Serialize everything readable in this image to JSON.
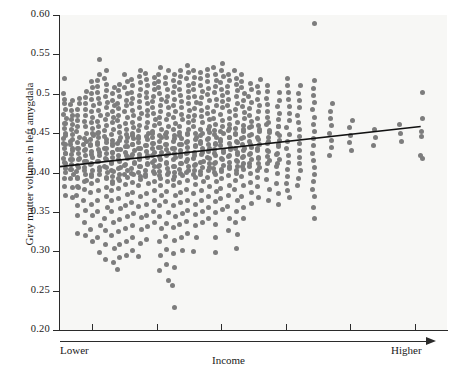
{
  "chart_data": {
    "type": "scatter",
    "title": "",
    "xlabel": "Income",
    "ylabel": "Gray matter volume in left amygdala",
    "x_axis": {
      "low_label": "Lower",
      "high_label": "Higher",
      "tick_labels": [
        "",
        "",
        "",
        "",
        "",
        ""
      ],
      "n_ticks": 6,
      "range_note": "ordinal income bins, unlabeled ticks"
    },
    "y_axis": {
      "tick_labels": [
        "0.20",
        "0.25",
        "0.30",
        "0.35",
        "0.40",
        "0.45",
        "0.5",
        "0.55",
        "0.60"
      ],
      "tick_values": [
        0.2,
        0.25,
        0.3,
        0.35,
        0.4,
        0.45,
        0.5,
        0.55,
        0.6
      ],
      "ylim": [
        0.2,
        0.6
      ]
    },
    "grid": false,
    "legend": null,
    "marker_color": "#7d7d7d",
    "background_color": "#f7f7f5",
    "trendline": {
      "color": "#111111",
      "x_start_frac": 0.0,
      "x_end_frac": 0.932,
      "y_start": 0.4075,
      "y_end": 0.4585
    },
    "columns": [
      {
        "x_frac": 0.012,
        "values": [
          0.405,
          0.412,
          0.418,
          0.424,
          0.43,
          0.437,
          0.443,
          0.45,
          0.456,
          0.462,
          0.468,
          0.474,
          0.48,
          0.488,
          0.493,
          0.5,
          0.519,
          0.462,
          0.447,
          0.436,
          0.424,
          0.413,
          0.4,
          0.392,
          0.382,
          0.371
        ]
      },
      {
        "x_frac": 0.03,
        "values": [
          0.398,
          0.404,
          0.41,
          0.417,
          0.423,
          0.43,
          0.436,
          0.442,
          0.448,
          0.455,
          0.461,
          0.467,
          0.473,
          0.479,
          0.486,
          0.492,
          0.44,
          0.428,
          0.416,
          0.404,
          0.393,
          0.381,
          0.368
        ]
      },
      {
        "x_frac": 0.047,
        "values": [
          0.381,
          0.392,
          0.401,
          0.409,
          0.417,
          0.424,
          0.431,
          0.438,
          0.445,
          0.452,
          0.459,
          0.466,
          0.473,
          0.48,
          0.487,
          0.494,
          0.43,
          0.418,
          0.406,
          0.394,
          0.382,
          0.371,
          0.358,
          0.345,
          0.322
        ]
      },
      {
        "x_frac": 0.065,
        "values": [
          0.389,
          0.398,
          0.406,
          0.414,
          0.421,
          0.429,
          0.436,
          0.443,
          0.45,
          0.458,
          0.465,
          0.472,
          0.48,
          0.488,
          0.495,
          0.503,
          0.44,
          0.428,
          0.414,
          0.403,
          0.39,
          0.378,
          0.365,
          0.352,
          0.336,
          0.32
        ]
      },
      {
        "x_frac": 0.082,
        "values": [
          0.395,
          0.403,
          0.411,
          0.419,
          0.427,
          0.434,
          0.442,
          0.449,
          0.456,
          0.463,
          0.47,
          0.478,
          0.485,
          0.493,
          0.5,
          0.508,
          0.516,
          0.447,
          0.435,
          0.423,
          0.41,
          0.398,
          0.386,
          0.374,
          0.36,
          0.346,
          0.328,
          0.313
        ]
      },
      {
        "x_frac": 0.1,
        "values": [
          0.398,
          0.406,
          0.414,
          0.421,
          0.429,
          0.436,
          0.444,
          0.451,
          0.458,
          0.465,
          0.472,
          0.479,
          0.487,
          0.494,
          0.501,
          0.509,
          0.517,
          0.525,
          0.543,
          0.45,
          0.438,
          0.426,
          0.414,
          0.402,
          0.39,
          0.377,
          0.365,
          0.35,
          0.333,
          0.317,
          0.298
        ]
      },
      {
        "x_frac": 0.118,
        "values": [
          0.392,
          0.4,
          0.408,
          0.416,
          0.424,
          0.431,
          0.438,
          0.446,
          0.453,
          0.46,
          0.467,
          0.474,
          0.482,
          0.489,
          0.496,
          0.504,
          0.512,
          0.52,
          0.53,
          0.442,
          0.43,
          0.418,
          0.406,
          0.394,
          0.381,
          0.369,
          0.356,
          0.341,
          0.326,
          0.308,
          0.29
        ]
      },
      {
        "x_frac": 0.136,
        "values": [
          0.386,
          0.395,
          0.403,
          0.411,
          0.419,
          0.426,
          0.434,
          0.441,
          0.448,
          0.455,
          0.463,
          0.47,
          0.477,
          0.485,
          0.492,
          0.5,
          0.508,
          0.437,
          0.425,
          0.413,
          0.401,
          0.389,
          0.377,
          0.364,
          0.35,
          0.336,
          0.32,
          0.304,
          0.286
        ]
      },
      {
        "x_frac": 0.153,
        "values": [
          0.39,
          0.398,
          0.406,
          0.414,
          0.422,
          0.429,
          0.437,
          0.444,
          0.451,
          0.459,
          0.466,
          0.473,
          0.481,
          0.488,
          0.496,
          0.504,
          0.512,
          0.441,
          0.429,
          0.417,
          0.405,
          0.393,
          0.38,
          0.367,
          0.354,
          0.34,
          0.325,
          0.309,
          0.292,
          0.277
        ]
      },
      {
        "x_frac": 0.171,
        "values": [
          0.394,
          0.402,
          0.41,
          0.418,
          0.425,
          0.433,
          0.44,
          0.448,
          0.455,
          0.462,
          0.47,
          0.477,
          0.485,
          0.492,
          0.5,
          0.508,
          0.516,
          0.524,
          0.445,
          0.433,
          0.421,
          0.409,
          0.397,
          0.385,
          0.372,
          0.358,
          0.344,
          0.329,
          0.312,
          0.294
        ]
      },
      {
        "x_frac": 0.188,
        "values": [
          0.397,
          0.405,
          0.413,
          0.42,
          0.428,
          0.435,
          0.443,
          0.45,
          0.457,
          0.464,
          0.472,
          0.479,
          0.487,
          0.494,
          0.502,
          0.51,
          0.518,
          0.447,
          0.435,
          0.423,
          0.411,
          0.399,
          0.387,
          0.375,
          0.362,
          0.348,
          0.333,
          0.317,
          0.301
        ]
      },
      {
        "x_frac": 0.206,
        "values": [
          0.391,
          0.4,
          0.408,
          0.416,
          0.423,
          0.431,
          0.438,
          0.446,
          0.453,
          0.46,
          0.468,
          0.475,
          0.483,
          0.49,
          0.498,
          0.506,
          0.514,
          0.522,
          0.53,
          0.443,
          0.431,
          0.419,
          0.407,
          0.395,
          0.383,
          0.37,
          0.357,
          0.343,
          0.327,
          0.31,
          0.293
        ]
      },
      {
        "x_frac": 0.224,
        "values": [
          0.395,
          0.403,
          0.411,
          0.419,
          0.427,
          0.434,
          0.442,
          0.449,
          0.457,
          0.464,
          0.472,
          0.479,
          0.487,
          0.495,
          0.502,
          0.51,
          0.518,
          0.526,
          0.446,
          0.434,
          0.422,
          0.41,
          0.398,
          0.386,
          0.373,
          0.36,
          0.346,
          0.331,
          0.315
        ]
      },
      {
        "x_frac": 0.242,
        "values": [
          0.399,
          0.407,
          0.415,
          0.422,
          0.43,
          0.437,
          0.445,
          0.452,
          0.46,
          0.467,
          0.475,
          0.482,
          0.49,
          0.497,
          0.505,
          0.513,
          0.521,
          0.449,
          0.437,
          0.425,
          0.413,
          0.401,
          0.389,
          0.377,
          0.364,
          0.351,
          0.337
        ]
      },
      {
        "x_frac": 0.259,
        "values": [
          0.393,
          0.401,
          0.409,
          0.417,
          0.425,
          0.432,
          0.44,
          0.447,
          0.455,
          0.462,
          0.47,
          0.477,
          0.485,
          0.493,
          0.5,
          0.508,
          0.516,
          0.524,
          0.533,
          0.444,
          0.432,
          0.42,
          0.408,
          0.396,
          0.384,
          0.371,
          0.358,
          0.344,
          0.329,
          0.312,
          0.294,
          0.276
        ]
      },
      {
        "x_frac": 0.277,
        "values": [
          0.397,
          0.405,
          0.413,
          0.421,
          0.429,
          0.436,
          0.444,
          0.451,
          0.459,
          0.467,
          0.474,
          0.482,
          0.49,
          0.497,
          0.505,
          0.513,
          0.521,
          0.529,
          0.448,
          0.436,
          0.424,
          0.412,
          0.4,
          0.388,
          0.376,
          0.363,
          0.349,
          0.335,
          0.319,
          0.302,
          0.283,
          0.263
        ]
      },
      {
        "x_frac": 0.295,
        "values": [
          0.391,
          0.4,
          0.408,
          0.416,
          0.424,
          0.431,
          0.439,
          0.447,
          0.454,
          0.462,
          0.47,
          0.477,
          0.485,
          0.493,
          0.501,
          0.509,
          0.517,
          0.525,
          0.443,
          0.431,
          0.419,
          0.407,
          0.395,
          0.383,
          0.371,
          0.358,
          0.344,
          0.33,
          0.314,
          0.297,
          0.279,
          0.256,
          0.229
        ]
      },
      {
        "x_frac": 0.312,
        "values": [
          0.396,
          0.404,
          0.412,
          0.42,
          0.428,
          0.436,
          0.443,
          0.451,
          0.459,
          0.467,
          0.474,
          0.482,
          0.49,
          0.498,
          0.506,
          0.514,
          0.522,
          0.53,
          0.447,
          0.435,
          0.423,
          0.411,
          0.399,
          0.387,
          0.375,
          0.362,
          0.348,
          0.334,
          0.318,
          0.301
        ]
      },
      {
        "x_frac": 0.33,
        "values": [
          0.4,
          0.408,
          0.416,
          0.424,
          0.432,
          0.44,
          0.448,
          0.455,
          0.463,
          0.471,
          0.479,
          0.487,
          0.495,
          0.503,
          0.511,
          0.519,
          0.527,
          0.536,
          0.45,
          0.438,
          0.426,
          0.414,
          0.402,
          0.39,
          0.378,
          0.365,
          0.352,
          0.338,
          0.323
        ]
      },
      {
        "x_frac": 0.348,
        "values": [
          0.394,
          0.402,
          0.41,
          0.418,
          0.426,
          0.434,
          0.442,
          0.45,
          0.458,
          0.466,
          0.473,
          0.481,
          0.489,
          0.497,
          0.505,
          0.513,
          0.521,
          0.529,
          0.445,
          0.433,
          0.421,
          0.409,
          0.397,
          0.385,
          0.373,
          0.36,
          0.347,
          0.333,
          0.317,
          0.3
        ]
      },
      {
        "x_frac": 0.366,
        "values": [
          0.398,
          0.406,
          0.414,
          0.423,
          0.431,
          0.439,
          0.447,
          0.455,
          0.463,
          0.471,
          0.479,
          0.487,
          0.495,
          0.503,
          0.511,
          0.519,
          0.527,
          0.449,
          0.437,
          0.425,
          0.413,
          0.401,
          0.389,
          0.377,
          0.364,
          0.35,
          0.336
        ]
      },
      {
        "x_frac": 0.384,
        "values": [
          0.403,
          0.411,
          0.419,
          0.427,
          0.435,
          0.443,
          0.451,
          0.459,
          0.467,
          0.475,
          0.483,
          0.491,
          0.499,
          0.507,
          0.515,
          0.523,
          0.531,
          0.454,
          0.442,
          0.43,
          0.418,
          0.406,
          0.394,
          0.382,
          0.369,
          0.355,
          0.341
        ]
      },
      {
        "x_frac": 0.401,
        "values": [
          0.397,
          0.405,
          0.413,
          0.421,
          0.429,
          0.437,
          0.445,
          0.453,
          0.461,
          0.469,
          0.477,
          0.485,
          0.493,
          0.501,
          0.509,
          0.517,
          0.525,
          0.533,
          0.448,
          0.436,
          0.424,
          0.412,
          0.4,
          0.388,
          0.376,
          0.363,
          0.349,
          0.334,
          0.318,
          0.299
        ]
      },
      {
        "x_frac": 0.419,
        "values": [
          0.401,
          0.409,
          0.418,
          0.426,
          0.434,
          0.442,
          0.45,
          0.458,
          0.466,
          0.474,
          0.482,
          0.49,
          0.498,
          0.506,
          0.514,
          0.522,
          0.53,
          0.539,
          0.452,
          0.44,
          0.428,
          0.416,
          0.404,
          0.392,
          0.38,
          0.367,
          0.353
        ]
      },
      {
        "x_frac": 0.437,
        "values": [
          0.405,
          0.413,
          0.421,
          0.429,
          0.437,
          0.445,
          0.453,
          0.461,
          0.469,
          0.477,
          0.485,
          0.493,
          0.501,
          0.509,
          0.517,
          0.525,
          0.456,
          0.444,
          0.432,
          0.42,
          0.408,
          0.396,
          0.384,
          0.371,
          0.357,
          0.342,
          0.326
        ]
      },
      {
        "x_frac": 0.455,
        "values": [
          0.399,
          0.407,
          0.415,
          0.423,
          0.431,
          0.44,
          0.448,
          0.456,
          0.464,
          0.472,
          0.48,
          0.488,
          0.496,
          0.504,
          0.512,
          0.52,
          0.529,
          0.45,
          0.438,
          0.426,
          0.414,
          0.402,
          0.39,
          0.378,
          0.365,
          0.351,
          0.337,
          0.321,
          0.304
        ]
      },
      {
        "x_frac": 0.473,
        "values": [
          0.404,
          0.412,
          0.42,
          0.428,
          0.436,
          0.444,
          0.452,
          0.46,
          0.468,
          0.476,
          0.484,
          0.492,
          0.5,
          0.508,
          0.516,
          0.524,
          0.455,
          0.443,
          0.431,
          0.419,
          0.407,
          0.395,
          0.383,
          0.37,
          0.356,
          0.341
        ]
      },
      {
        "x_frac": 0.492,
        "values": [
          0.408,
          0.416,
          0.424,
          0.432,
          0.44,
          0.448,
          0.457,
          0.465,
          0.473,
          0.481,
          0.489,
          0.497,
          0.505,
          0.513,
          0.459,
          0.447,
          0.435,
          0.423,
          0.411,
          0.399,
          0.387,
          0.374,
          0.361
        ]
      },
      {
        "x_frac": 0.513,
        "values": [
          0.403,
          0.411,
          0.419,
          0.428,
          0.436,
          0.444,
          0.452,
          0.46,
          0.468,
          0.477,
          0.485,
          0.493,
          0.501,
          0.509,
          0.518,
          0.454,
          0.442,
          0.43,
          0.418,
          0.406,
          0.394,
          0.382,
          0.368
        ]
      },
      {
        "x_frac": 0.537,
        "values": [
          0.412,
          0.42,
          0.428,
          0.437,
          0.445,
          0.453,
          0.461,
          0.47,
          0.478,
          0.486,
          0.494,
          0.503,
          0.511,
          0.463,
          0.451,
          0.439,
          0.427,
          0.415,
          0.403,
          0.391,
          0.378,
          0.365
        ]
      },
      {
        "x_frac": 0.563,
        "values": [
          0.407,
          0.416,
          0.424,
          0.433,
          0.441,
          0.45,
          0.458,
          0.467,
          0.475,
          0.484,
          0.492,
          0.501,
          0.459,
          0.447,
          0.435,
          0.423,
          0.411,
          0.399,
          0.386,
          0.373,
          0.359
        ]
      },
      {
        "x_frac": 0.59,
        "values": [
          0.413,
          0.422,
          0.431,
          0.44,
          0.448,
          0.457,
          0.466,
          0.475,
          0.484,
          0.493,
          0.502,
          0.511,
          0.52,
          0.404,
          0.395,
          0.386,
          0.377,
          0.368
        ]
      },
      {
        "x_frac": 0.618,
        "values": [
          0.419,
          0.428,
          0.437,
          0.446,
          0.455,
          0.464,
          0.473,
          0.482,
          0.491,
          0.5,
          0.51,
          0.411,
          0.402,
          0.393,
          0.384
        ]
      },
      {
        "x_frac": 0.655,
        "values": [
          0.415,
          0.424,
          0.434,
          0.443,
          0.452,
          0.461,
          0.47,
          0.48,
          0.489,
          0.498,
          0.507,
          0.517,
          0.589,
          0.406,
          0.397,
          0.388,
          0.379,
          0.37,
          0.355,
          0.341
        ]
      },
      {
        "x_frac": 0.7,
        "values": [
          0.422,
          0.432,
          0.441,
          0.45,
          0.46,
          0.469,
          0.478,
          0.488
        ]
      },
      {
        "x_frac": 0.752,
        "values": [
          0.428,
          0.438,
          0.447,
          0.457,
          0.466
        ]
      },
      {
        "x_frac": 0.812,
        "values": [
          0.434,
          0.444,
          0.454
        ]
      },
      {
        "x_frac": 0.878,
        "values": [
          0.44,
          0.45,
          0.461
        ]
      },
      {
        "x_frac": 0.935,
        "values": [
          0.418,
          0.422,
          0.446,
          0.452,
          0.468,
          0.501
        ]
      }
    ]
  }
}
